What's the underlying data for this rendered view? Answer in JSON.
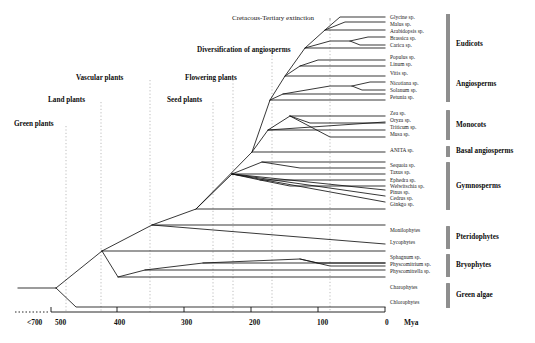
{
  "figure": {
    "type": "phylogenetic-tree",
    "axis_unit": "Mya"
  },
  "axis": {
    "unit": "Mya",
    "ticks": [
      {
        "label": "<700",
        "x": 27,
        "dotted": true
      },
      {
        "label": "500",
        "x": 55,
        "dotted": false
      },
      {
        "label": "400",
        "x": 114,
        "dotted": false
      },
      {
        "label": "300",
        "x": 181,
        "dotted": false
      },
      {
        "label": "200",
        "x": 249,
        "dotted": false
      },
      {
        "label": "100",
        "x": 317,
        "dotted": false
      },
      {
        "label": "0",
        "x": 385,
        "dotted": false
      }
    ]
  },
  "events": [
    {
      "id": "ktx",
      "label": "Cretacous-Tertiary extinction",
      "bold": false,
      "x": 232,
      "y": 14,
      "guide_x": 330
    },
    {
      "id": "diversification",
      "label": "Diversification of angiosperms",
      "bold": true,
      "x": 197,
      "y": 46,
      "guide_x": 272
    }
  ],
  "nodes": [
    {
      "id": "green-plants",
      "label": "Green plants",
      "x": 14,
      "y": 120,
      "guide_x": 66
    },
    {
      "id": "land-plants",
      "label": "Land plants",
      "x": 48,
      "y": 96,
      "guide_x": 101
    },
    {
      "id": "vascular-plants",
      "label": "Vascular plants",
      "x": 76,
      "y": 74,
      "guide_x": 150
    },
    {
      "id": "seed-plants",
      "label": "Seed plants",
      "x": 167,
      "y": 96,
      "guide_x": 213
    },
    {
      "id": "flowering-plants",
      "label": "Flowering plants",
      "x": 185,
      "y": 74,
      "guide_x": 233
    }
  ],
  "taxa": [
    {
      "label": "Glycine sp.",
      "y": 18
    },
    {
      "label": "Malus sp.",
      "y": 25
    },
    {
      "label": "Arabidopsis sp.",
      "y": 32
    },
    {
      "label": "Brassica sp.",
      "y": 39
    },
    {
      "label": "Carica sp.",
      "y": 46
    },
    {
      "label": "Populus sp.",
      "y": 58
    },
    {
      "label": "Linum sp.",
      "y": 65
    },
    {
      "label": "Vitis sp.",
      "y": 74
    },
    {
      "label": "Nicotiana sp.",
      "y": 84
    },
    {
      "label": "Solanum sp.",
      "y": 91
    },
    {
      "label": "Petunia sp.",
      "y": 98
    },
    {
      "label": "Zea sp.",
      "y": 114
    },
    {
      "label": "Oryza sp.",
      "y": 121
    },
    {
      "label": "Triticum sp.",
      "y": 128
    },
    {
      "label": "Musa sp.",
      "y": 135
    },
    {
      "label": "ANITA sp.",
      "y": 151
    },
    {
      "label": "Sequoia sp.",
      "y": 166
    },
    {
      "label": "Taxus sp.",
      "y": 173
    },
    {
      "label": "Ephedra sp.",
      "y": 181
    },
    {
      "label": "Welwitschia sp.",
      "y": 187
    },
    {
      "label": "Pinus sp.",
      "y": 193
    },
    {
      "label": "Cedrus sp.",
      "y": 199
    },
    {
      "label": "Ginkgo sp.",
      "y": 205
    },
    {
      "label": "Monilophytes",
      "y": 231
    },
    {
      "label": "Lycophytes",
      "y": 243
    },
    {
      "label": "Sphagnum sp.",
      "y": 258
    },
    {
      "label": "Physcomitrium sp.",
      "y": 265
    },
    {
      "label": "Physcomitrella sp.",
      "y": 272
    },
    {
      "label": "Charophytes",
      "y": 288
    },
    {
      "label": "Chlorophytes",
      "y": 303
    }
  ],
  "groups": [
    {
      "id": "eudicots",
      "label": "Eudicots",
      "bar_top": 14,
      "bar_bottom": 102,
      "label_y": 44
    },
    {
      "id": "angiosperms",
      "label": "Angiosperms",
      "bar_top": 14,
      "bar_bottom": 102,
      "label_y": 84
    },
    {
      "id": "monocots",
      "label": "Monocots",
      "bar_top": 110,
      "bar_bottom": 140,
      "label_y": 125
    },
    {
      "id": "basal-angiosperms",
      "label": "Basal angiosperms",
      "bar_top": 146,
      "bar_bottom": 157,
      "label_y": 151
    },
    {
      "id": "gymnosperms",
      "label": "Gymnosperms",
      "bar_top": 162,
      "bar_bottom": 210,
      "label_y": 186
    },
    {
      "id": "pteridophytes",
      "label": "Pteridophytes",
      "bar_top": 226,
      "bar_bottom": 249,
      "label_y": 237
    },
    {
      "id": "bryophytes",
      "label": "Bryophytes",
      "bar_top": 254,
      "bar_bottom": 277,
      "label_y": 265
    },
    {
      "id": "green-algae",
      "label": "Green algae",
      "bar_top": 283,
      "bar_bottom": 308,
      "label_y": 295
    }
  ],
  "colors": {
    "branch": "#141414",
    "group_bar": "#8e8e8e",
    "guide": "#9a9a9a",
    "axis": "#111111",
    "background": "#ffffff"
  },
  "tree_geometry": {
    "root_x": 56,
    "tip_x": 385,
    "label_x": 390,
    "branches": [
      {
        "from": [
          20,
          288
        ],
        "to": [
          56,
          288
        ]
      },
      {
        "from": [
          56,
          288
        ],
        "to": [
          56,
          288
        ]
      },
      {
        "from": [
          56,
          288
        ],
        "to": [
          75,
          307
        ]
      },
      {
        "from": [
          75,
          307
        ],
        "to": [
          385,
          307
        ]
      },
      {
        "from": [
          56,
          288
        ],
        "to": [
          102,
          251
        ]
      },
      {
        "from": [
          102,
          251
        ],
        "to": [
          385,
          251
        ]
      },
      {
        "from": [
          102,
          251
        ],
        "to": [
          117,
          277
        ]
      },
      {
        "from": [
          117,
          277
        ],
        "to": [
          385,
          277
        ]
      },
      {
        "from": [
          117,
          277
        ],
        "to": [
          142,
          270
        ]
      },
      {
        "from": [
          142,
          270
        ],
        "to": [
          385,
          270
        ]
      },
      {
        "from": [
          142,
          270
        ],
        "to": [
          200,
          263
        ]
      },
      {
        "from": [
          200,
          263
        ],
        "to": [
          385,
          263
        ]
      },
      {
        "from": [
          200,
          263
        ],
        "to": [
          300,
          263
        ]
      },
      {
        "from": [
          300,
          263
        ],
        "to": [
          330,
          270
        ]
      },
      {
        "from": [
          102,
          251
        ],
        "to": [
          152,
          224
        ]
      },
      {
        "from": [
          152,
          224
        ],
        "to": [
          385,
          224
        ]
      },
      {
        "from": [
          152,
          224
        ],
        "to": [
          385,
          246
        ]
      },
      {
        "from": [
          152,
          224
        ],
        "to": [
          195,
          209
        ]
      },
      {
        "from": [
          195,
          209
        ],
        "to": [
          385,
          209
        ]
      },
      {
        "from": [
          195,
          209
        ],
        "to": [
          232,
          172
        ]
      },
      {
        "from": [
          232,
          172
        ],
        "to": [
          385,
          172
        ]
      },
      {
        "from": [
          232,
          172
        ],
        "to": [
          260,
          160
        ]
      },
      {
        "from": [
          260,
          160
        ],
        "to": [
          385,
          160
        ]
      },
      {
        "from": [
          232,
          172
        ],
        "to": [
          385,
          190
        ]
      },
      {
        "from": [
          232,
          172
        ],
        "to": [
          385,
          197
        ]
      },
      {
        "from": [
          232,
          172
        ],
        "to": [
          385,
          203
        ]
      },
      {
        "from": [
          195,
          209
        ],
        "to": [
          250,
          152
        ]
      },
      {
        "from": [
          250,
          152
        ],
        "to": [
          385,
          152
        ]
      },
      {
        "from": [
          250,
          152
        ],
        "to": [
          270,
          120
        ]
      },
      {
        "from": [
          270,
          120
        ],
        "to": [
          385,
          120
        ]
      }
    ]
  }
}
